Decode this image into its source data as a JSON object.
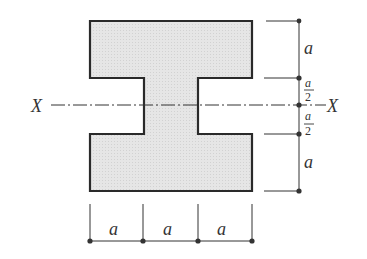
{
  "diagram": {
    "type": "cross-section",
    "colors": {
      "fill": "#e4e4e4",
      "outline": "#2a2a2a",
      "dimension": "#333333",
      "background": "#ffffff"
    },
    "axis": {
      "left_label": "X",
      "right_label": "X",
      "style": "dash-dot"
    },
    "vertical_dimensions": [
      {
        "label": "a",
        "segment": "top flange height"
      },
      {
        "label_numerator": "a",
        "label_denominator": "2",
        "segment": "upper web half"
      },
      {
        "label_numerator": "a",
        "label_denominator": "2",
        "segment": "lower web half"
      },
      {
        "label": "a",
        "segment": "bottom flange height"
      }
    ],
    "horizontal_dimensions": [
      {
        "label": "a",
        "segment": "left overhang"
      },
      {
        "label": "a",
        "segment": "web width"
      },
      {
        "label": "a",
        "segment": "right overhang"
      }
    ]
  }
}
